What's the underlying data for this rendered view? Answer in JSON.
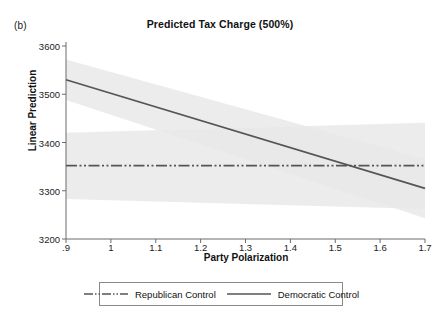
{
  "panel": {
    "label": "(b)"
  },
  "chart_data": {
    "type": "line",
    "title": "Predicted Tax Charge (500%)",
    "xlabel": "Party Polarization",
    "ylabel": "Linear Prediction",
    "xlim": [
      0.9,
      1.7
    ],
    "ylim": [
      3200,
      3600
    ],
    "xticks": [
      ".9",
      "1",
      "1.1",
      "1.2",
      "1.3",
      "1.4",
      "1.5",
      "1.6",
      "1.7"
    ],
    "xtick_values": [
      0.9,
      1.0,
      1.1,
      1.2,
      1.3,
      1.4,
      1.5,
      1.6,
      1.7
    ],
    "yticks": [
      "3600",
      "3500",
      "3400",
      "3300",
      "3200"
    ],
    "ytick_values": [
      3600,
      3500,
      3400,
      3300,
      3200
    ],
    "grid": false,
    "legend_position": "bottom",
    "series": [
      {
        "name": "Republican Control",
        "style": "dash-dot",
        "color": "#555555",
        "x": [
          0.9,
          1.7
        ],
        "values": [
          3352,
          3352
        ],
        "ci_lower": [
          3283,
          3262
        ],
        "ci_upper": [
          3420,
          3441
        ]
      },
      {
        "name": "Democratic Control",
        "style": "solid",
        "color": "#555555",
        "x": [
          0.9,
          1.7
        ],
        "values": [
          3530,
          3305
        ],
        "ci_lower": [
          3488,
          3243
        ],
        "ci_upper": [
          3572,
          3366
        ]
      }
    ],
    "band_color": "#e9e9e9",
    "axis_color": "#6b6b6b",
    "crossing_point": {
      "x": 1.52,
      "y": 3352
    }
  }
}
